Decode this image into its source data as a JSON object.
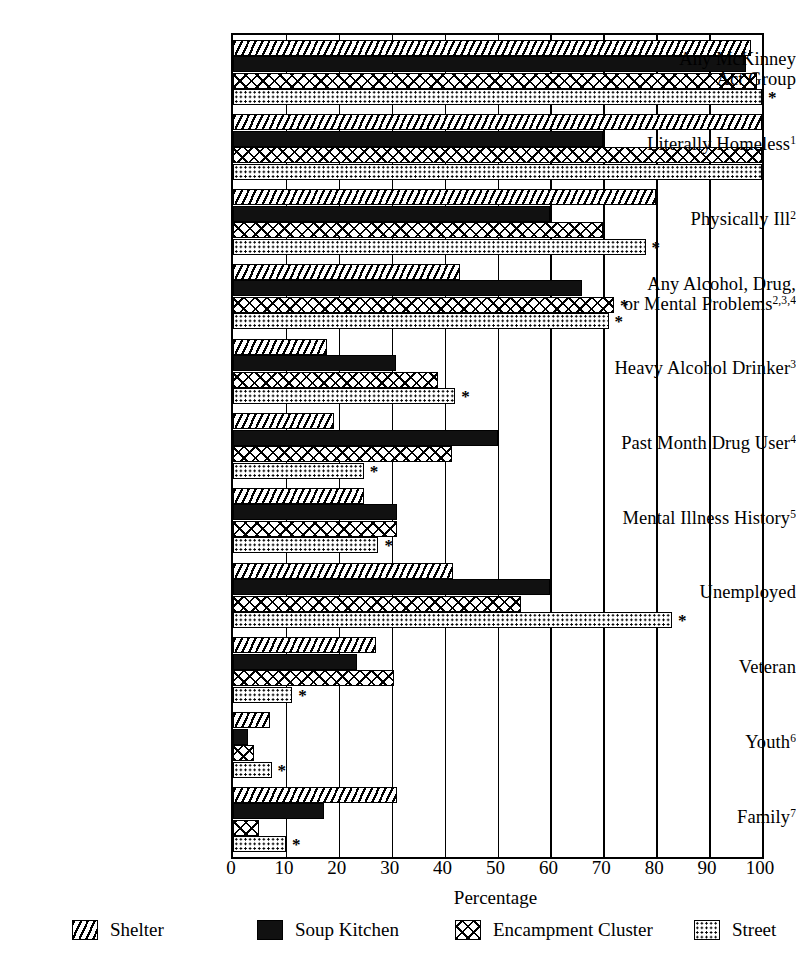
{
  "chart_data": {
    "type": "bar",
    "orientation": "horizontal",
    "title": "",
    "xlabel": "Percentage",
    "ylabel": "",
    "xlim": [
      0,
      100
    ],
    "xticks": [
      0,
      10,
      20,
      30,
      40,
      50,
      60,
      70,
      80,
      90,
      100
    ],
    "grid": true,
    "legend_position": "bottom",
    "significance_marker": "*",
    "categories": [
      "Any McKinney Act Group",
      "Literally Homeless",
      "Physically Ill",
      "Any Alcohol, Drug, or Mental Problems",
      "Heavy Alcohol Drinker",
      "Past Month Drug User",
      "Mental Illness History",
      "Unemployed",
      "Veteran",
      "Youth",
      "Family"
    ],
    "category_footnotes": [
      "",
      "1",
      "2",
      "2,3,4",
      "3",
      "4",
      "5",
      "",
      "",
      "6",
      "7"
    ],
    "series": [
      {
        "name": "Shelter",
        "pattern": "diagonal-hatch",
        "values": [
          98,
          100,
          80,
          43,
          17.7,
          19,
          24.7,
          41.5,
          27,
          7,
          31
        ],
        "starred": [
          false,
          false,
          false,
          false,
          false,
          false,
          false,
          false,
          false,
          false,
          false
        ]
      },
      {
        "name": "Soup Kitchen",
        "pattern": "solid-black",
        "values": [
          97,
          70,
          60,
          66,
          30.8,
          50,
          31,
          60,
          23.4,
          2.8,
          17.2
        ],
        "starred": [
          false,
          false,
          false,
          false,
          false,
          false,
          false,
          false,
          false,
          false,
          false
        ]
      },
      {
        "name": "Encampment Cluster",
        "pattern": "cross-hatch",
        "values": [
          99,
          100,
          70,
          72,
          38.8,
          41.4,
          31,
          54.5,
          30.5,
          4,
          4.9
        ],
        "starred": [
          false,
          false,
          false,
          true,
          false,
          false,
          false,
          false,
          false,
          false,
          false
        ]
      },
      {
        "name": "Street",
        "pattern": "dotted",
        "values": [
          100,
          100,
          78,
          71,
          42,
          24.7,
          27.5,
          83,
          11.2,
          7.3,
          10
        ],
        "starred": [
          true,
          false,
          true,
          true,
          true,
          true,
          true,
          true,
          true,
          true,
          true
        ]
      }
    ]
  },
  "axis": {
    "ticks": [
      "0",
      "10",
      "20",
      "30",
      "40",
      "50",
      "60",
      "70",
      "80",
      "90",
      "100"
    ],
    "label": "Percentage"
  },
  "legend": {
    "items": [
      {
        "label": "Shelter",
        "swatch": "diagonal-hatch-swatch"
      },
      {
        "label": "Soup Kitchen",
        "swatch": "solid-black-swatch"
      },
      {
        "label": "Encampment Cluster",
        "swatch": "cross-hatch-swatch"
      },
      {
        "label": "Street",
        "swatch": "dotted-swatch"
      }
    ]
  },
  "labels": {
    "rows": [
      {
        "line1": "Any McKinney",
        "line2": "Act Group",
        "sup": ""
      },
      {
        "line1": "Literally Homeless",
        "line2": "",
        "sup": "1"
      },
      {
        "line1": "Physically Ill",
        "line2": "",
        "sup": "2"
      },
      {
        "line1": "Any Alcohol, Drug,",
        "line2": "or Mental Problems",
        "sup": "2,3,4"
      },
      {
        "line1": "Heavy Alcohol Drinker",
        "line2": "",
        "sup": "3"
      },
      {
        "line1": "Past Month Drug User",
        "line2": "",
        "sup": "4"
      },
      {
        "line1": "Mental Illness History",
        "line2": "",
        "sup": "5"
      },
      {
        "line1": "Unemployed",
        "line2": "",
        "sup": ""
      },
      {
        "line1": "Veteran",
        "line2": "",
        "sup": ""
      },
      {
        "line1": "Youth",
        "line2": "",
        "sup": "6"
      },
      {
        "line1": "Family",
        "line2": "",
        "sup": "7"
      }
    ]
  }
}
